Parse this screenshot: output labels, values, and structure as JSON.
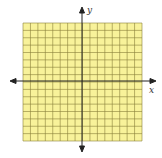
{
  "diagram": {
    "type": "coordinate-grid",
    "grid": {
      "cells_x": 16,
      "cells_y": 16,
      "fill": "#f8f29a",
      "line_color": "#8a7f3a"
    },
    "axes": {
      "color": "#222222",
      "x_label": "x",
      "y_label": "y"
    }
  }
}
